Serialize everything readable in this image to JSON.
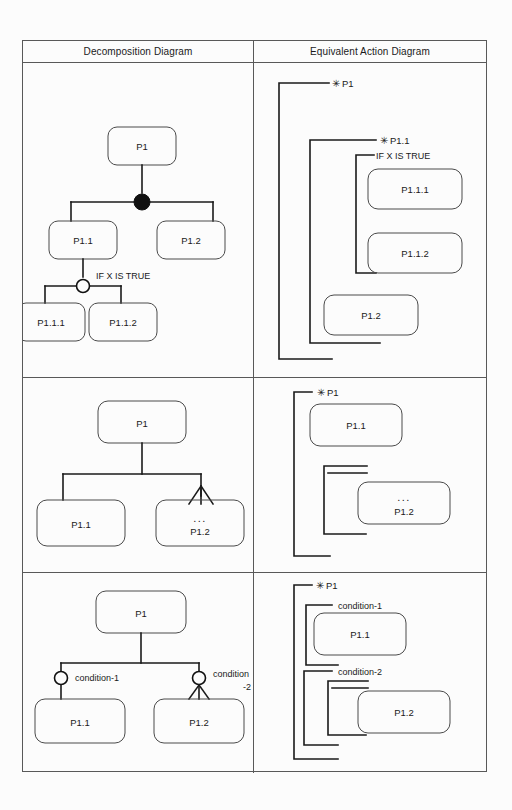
{
  "page": {
    "background": "#fcfcfc",
    "ink": "#1a1a1a",
    "rule_color": "#595959"
  },
  "table": {
    "headers": [
      {
        "id": "decomposition",
        "label": "Decomposition Diagram"
      },
      {
        "id": "action",
        "label": "Equivalent Action Diagram"
      }
    ],
    "row_count": 3
  },
  "rows": [
    {
      "id": "row-1-sequence-selection",
      "decomposition": {
        "nodes": [
          {
            "id": "p1",
            "label": "P1"
          },
          {
            "id": "p1-1",
            "label": "P1.1"
          },
          {
            "id": "p1-2",
            "label": "P1.2"
          },
          {
            "id": "p1-1-1",
            "label": "P1.1.1"
          },
          {
            "id": "p1-1-2",
            "label": "P1.1.2"
          }
        ],
        "connectors": [
          {
            "id": "sequence-node",
            "type": "filled-circle",
            "label": ""
          },
          {
            "id": "selection-node",
            "type": "open-circle",
            "label": "IF X IS TRUE"
          }
        ]
      },
      "action": {
        "brackets": [
          {
            "id": "bracket-p1",
            "marker": "asterisk",
            "label": "P1"
          },
          {
            "id": "bracket-p1-1",
            "marker": "asterisk",
            "label": "P1.1"
          },
          {
            "id": "bracket-cond",
            "marker": "none",
            "label": "IF X IS TRUE"
          }
        ],
        "boxes": [
          {
            "id": "a-p1-1-1",
            "label": "P1.1.1"
          },
          {
            "id": "a-p1-1-2",
            "label": "P1.1.2"
          },
          {
            "id": "a-p1-2",
            "label": "P1.2"
          }
        ]
      }
    },
    {
      "id": "row-2-repetition",
      "decomposition": {
        "nodes": [
          {
            "id": "p1",
            "label": "P1"
          },
          {
            "id": "p1-1",
            "label": "P1.1"
          },
          {
            "id": "p1-2",
            "label": "P1.2",
            "repeat_marker": true,
            "repeat_glyph": "..."
          }
        ],
        "connectors": []
      },
      "action": {
        "brackets": [
          {
            "id": "bracket-p1",
            "marker": "asterisk",
            "label": "P1"
          },
          {
            "id": "bracket-repeat",
            "marker": "none",
            "label": ""
          }
        ],
        "boxes": [
          {
            "id": "a-p1-1",
            "label": "P1.1"
          },
          {
            "id": "a-p1-2",
            "label": "P1.2",
            "repeat_glyph": "..."
          }
        ]
      }
    },
    {
      "id": "row-3-conditions",
      "decomposition": {
        "nodes": [
          {
            "id": "p1",
            "label": "P1"
          },
          {
            "id": "p1-1",
            "label": "P1.1"
          },
          {
            "id": "p1-2",
            "label": "P1.2",
            "repeat_marker": true
          }
        ],
        "connectors": [
          {
            "id": "cond-1-node",
            "type": "open-circle",
            "label": "condition-1"
          },
          {
            "id": "cond-2-node",
            "type": "open-circle",
            "label_line1": "condition",
            "label_line2": "-2"
          }
        ]
      },
      "action": {
        "brackets": [
          {
            "id": "bracket-p1",
            "marker": "asterisk",
            "label": "P1"
          },
          {
            "id": "bracket-cond-1",
            "marker": "none",
            "label": "condition-1"
          },
          {
            "id": "bracket-cond-2",
            "marker": "none",
            "label": "condition-2"
          },
          {
            "id": "bracket-repeat",
            "marker": "none",
            "label": ""
          }
        ],
        "boxes": [
          {
            "id": "a-p1-1",
            "label": "P1.1"
          },
          {
            "id": "a-p1-2",
            "label": "P1.2"
          }
        ]
      }
    }
  ],
  "glyphs": {
    "asterisk": "✳",
    "ellipsis": "...",
    "filled_circle": "filled-circle-icon",
    "open_circle": "open-circle-icon",
    "crows_foot": "crows-foot-icon"
  }
}
